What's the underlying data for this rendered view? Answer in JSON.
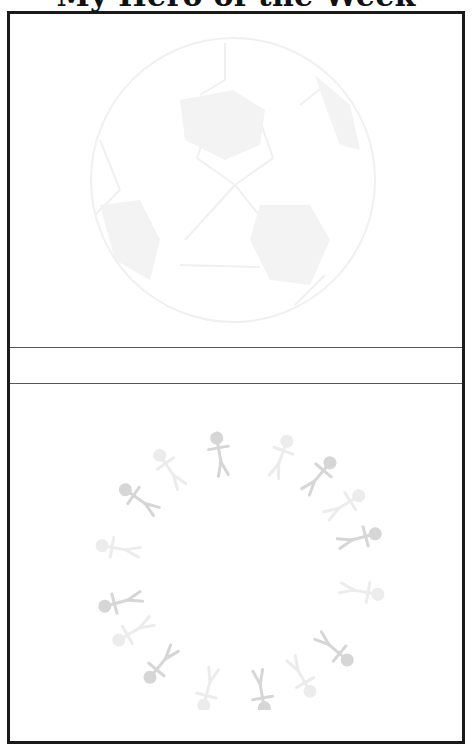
{
  "page": {
    "title": "My Hero of the Week"
  },
  "sections": [
    {
      "name": "photo-area-top",
      "graphic": "soccer-ball-watermark"
    },
    {
      "name": "name-line",
      "text": ""
    },
    {
      "name": "drawing-area-bottom",
      "graphic": "people-circle-watermark"
    }
  ],
  "colors": {
    "border": "#1a1a1a",
    "divider": "#555555",
    "watermark_ball": "#f2f2f2",
    "watermark_people": "#d9d9d9"
  }
}
